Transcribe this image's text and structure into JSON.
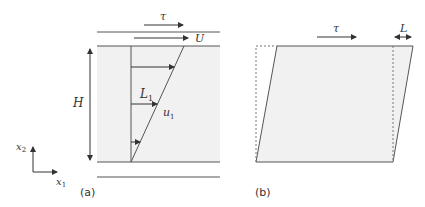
{
  "panel_a": {
    "label": "(a)",
    "tau": "τ",
    "U": "U",
    "H": "H",
    "L1": "L",
    "L1_sub": "1",
    "u1": "u",
    "u1_sub": "1",
    "axis_x": "x",
    "axis_x_sub": "1",
    "axis_y": "x",
    "axis_y_sub": "2"
  },
  "panel_b": {
    "label": "(b)",
    "tau": "τ",
    "L": "L"
  },
  "colors": {
    "fill": "#f1f1f1",
    "line": "#555555"
  }
}
